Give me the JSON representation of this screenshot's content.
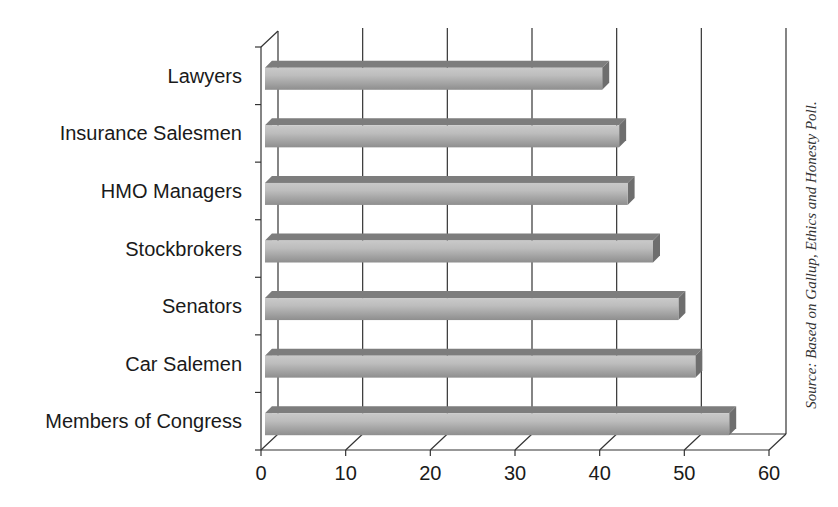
{
  "chart_data": {
    "type": "bar",
    "orientation": "horizontal",
    "style": "3d",
    "title": "",
    "xlabel": "",
    "ylabel": "",
    "categories": [
      "Lawyers",
      "Insurance Salesmen",
      "HMO Managers",
      "Stockbrokers",
      "Senators",
      "Car Salemen",
      "Members of Congress"
    ],
    "values": [
      39,
      41,
      42,
      45,
      48,
      50,
      54
    ],
    "xlim": [
      0,
      60
    ],
    "x_ticks": [
      0,
      10,
      20,
      30,
      40,
      50,
      60
    ],
    "grid": true,
    "legend": null,
    "bar_color": "#9a9a9a",
    "annotations": [
      "Source: Based on Gallup, Ethics and Honesty Poll."
    ]
  },
  "source_text": "Source: Based on Gallup, Ethics and Honesty Poll."
}
